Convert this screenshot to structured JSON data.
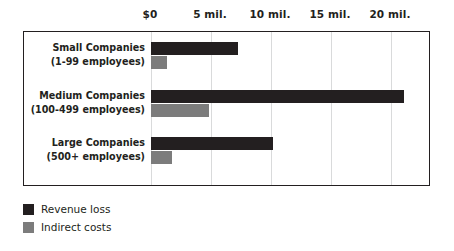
{
  "chart_data": {
    "type": "bar",
    "orientation": "horizontal",
    "title": "",
    "xlabel": "",
    "ylabel": "",
    "xlim": [
      0,
      22.25
    ],
    "grid": true,
    "legend_position": "bottom-left",
    "tick_labels": [
      "$0",
      "5 mil.",
      "10 mil.",
      "15 mil.",
      "20 mil."
    ],
    "tick_values": [
      0,
      5,
      10,
      15,
      20
    ],
    "categories": [
      "Small Companies",
      "Medium Companies",
      "Large Companies"
    ],
    "category_sublabels": [
      "(1-99 employees)",
      "(100-499 employees)",
      "(500+ employees)"
    ],
    "series": [
      {
        "name": "Revenue loss",
        "color": "#231f20",
        "values": [
          7.25,
          21.1,
          10.2
        ]
      },
      {
        "name": "Indirect costs",
        "color": "#7c7c7c",
        "values": [
          1.3,
          4.85,
          1.75
        ]
      }
    ]
  },
  "axis": {
    "ticks": [
      {
        "label": "$0",
        "value": 0
      },
      {
        "label": "5 mil.",
        "value": 5
      },
      {
        "label": "10 mil.",
        "value": 10
      },
      {
        "label": "15 mil.",
        "value": 15
      },
      {
        "label": "20 mil.",
        "value": 20
      }
    ]
  },
  "groups": [
    {
      "name": "Small Companies",
      "sublabel": "(1-99 employees)",
      "revenue_loss": 7.25,
      "indirect_costs": 1.3
    },
    {
      "name": "Medium Companies",
      "sublabel": "(100-499 employees)",
      "revenue_loss": 21.1,
      "indirect_costs": 4.85
    },
    {
      "name": "Large Companies",
      "sublabel": "(500+ employees)",
      "revenue_loss": 10.2,
      "indirect_costs": 1.75
    }
  ],
  "legend": [
    {
      "label": "Revenue loss",
      "color": "#231f20"
    },
    {
      "label": "Indirect costs",
      "color": "#7c7c7c"
    }
  ],
  "colors": {
    "primary": "#231f20",
    "secondary": "#7c7c7c",
    "gridline": "#d9dadb",
    "background": "#ffffff"
  }
}
